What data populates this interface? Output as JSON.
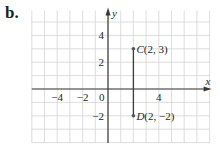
{
  "figure_label": "b.",
  "axes": {
    "x_label": "x",
    "y_label": "y",
    "x_ticks": [
      {
        "value": -4,
        "label": "−4"
      },
      {
        "value": -2,
        "label": "−2"
      },
      {
        "value": 0,
        "label": "0"
      },
      {
        "value": 4,
        "label": "4"
      }
    ],
    "y_ticks": [
      {
        "value": 4,
        "label": "4"
      },
      {
        "value": 2,
        "label": "2"
      },
      {
        "value": -2,
        "label": "−2"
      }
    ],
    "x_range": [
      -6,
      8
    ],
    "y_range": [
      -4,
      6
    ]
  },
  "points": [
    {
      "name": "C",
      "x": 2,
      "y": 3,
      "label": "C(2, 3)"
    },
    {
      "name": "D",
      "x": 2,
      "y": -2,
      "label": "D(2, −2)"
    }
  ],
  "segment": {
    "from": "C",
    "to": "D"
  },
  "colors": {
    "grid": "#d4d4d4",
    "axis": "#3a3a3a",
    "text": "#231f20",
    "point": "#555555"
  }
}
